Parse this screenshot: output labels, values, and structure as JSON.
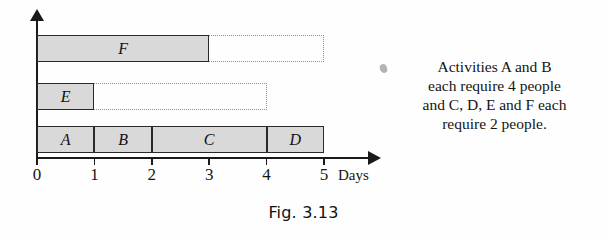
{
  "figure": {
    "caption": "Fig. 3.13"
  },
  "note": {
    "bullet": "bullet-mark",
    "lines": [
      "Activities A and B",
      "each require 4 people",
      "and C, D, E and F each",
      "require 2 people."
    ],
    "full_text": "Activities A and B each require 4 people and C, D, E and F each require 2 people."
  },
  "chart_data": {
    "type": "bar",
    "subtype": "gantt",
    "title": "Fig. 3.13",
    "xlabel": "Days",
    "ylabel": "",
    "xlim": [
      0,
      5
    ],
    "xticks": [
      0,
      1,
      2,
      3,
      4,
      5
    ],
    "xtick_labels": [
      "0",
      "1",
      "2",
      "3",
      "4",
      "5"
    ],
    "grid": false,
    "legend": false,
    "orientation": "horizontal",
    "bar_fill_color": "#d9d9d9",
    "bar_border_color": "#2a2a2a",
    "float_line_color": "#8d8d8d",
    "rows": [
      {
        "row_index": 0,
        "name": "row-F",
        "tasks": [
          {
            "label": "F",
            "start": 0,
            "end": 3,
            "duration": 3
          }
        ],
        "float": {
          "start": 3,
          "end": 5,
          "duration": 2
        }
      },
      {
        "row_index": 1,
        "name": "row-E",
        "tasks": [
          {
            "label": "E",
            "start": 0,
            "end": 1,
            "duration": 1
          }
        ],
        "float": {
          "start": 1,
          "end": 4,
          "duration": 3
        }
      },
      {
        "row_index": 2,
        "name": "row-ABCD",
        "tasks": [
          {
            "label": "A",
            "start": 0,
            "end": 1,
            "duration": 1
          },
          {
            "label": "B",
            "start": 1,
            "end": 2,
            "duration": 1
          },
          {
            "label": "C",
            "start": 2,
            "end": 4,
            "duration": 2
          },
          {
            "label": "D",
            "start": 4,
            "end": 5,
            "duration": 1
          }
        ],
        "float": null
      }
    ],
    "resources": [
      {
        "activity": "A",
        "people": 4
      },
      {
        "activity": "B",
        "people": 4
      },
      {
        "activity": "C",
        "people": 2
      },
      {
        "activity": "D",
        "people": 2
      },
      {
        "activity": "E",
        "people": 2
      },
      {
        "activity": "F",
        "people": 2
      }
    ]
  },
  "geometry": {
    "origin_x": 37,
    "unit_px": 57.4,
    "rows_y": [
      35,
      83,
      126
    ],
    "row_h": [
      27,
      27,
      27
    ]
  }
}
